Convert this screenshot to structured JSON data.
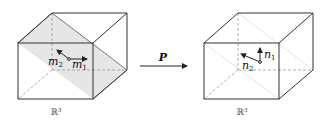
{
  "diagram": {
    "left_cube": {
      "space_label": "ℝ³",
      "vector_labels": {
        "m2": "m",
        "m2_sub": "2",
        "m1": "m",
        "m1_sub": "1"
      },
      "plane_fill": "#e6e6e6",
      "plane_shaded": true
    },
    "arrow": {
      "label": "P"
    },
    "right_cube": {
      "space_label": "ℝ³",
      "vector_labels": {
        "n2": "n",
        "n2_sub": "2",
        "n1": "n",
        "n1_sub": "1"
      },
      "plane_shaded": false
    },
    "colors": {
      "edge": "#333333",
      "hidden_edge": "#888888",
      "faint_plane_edge": "#dddddd"
    }
  }
}
